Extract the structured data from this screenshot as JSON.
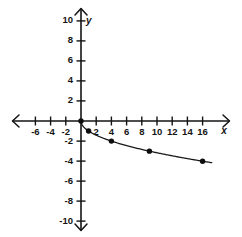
{
  "figure": {
    "width": 242,
    "height": 237,
    "background": "#ffffff",
    "ink_color": "#141414"
  },
  "axes": {
    "x_axis_label": "x",
    "y_axis_label": "y",
    "origin_label": "",
    "x_tick_labels": [
      "-6",
      "-4",
      "-2",
      "2",
      "4",
      "6",
      "8",
      "10",
      "12",
      "14",
      "16"
    ],
    "y_tick_labels": [
      "10",
      "8",
      "6",
      "4",
      "2",
      "-2",
      "-4",
      "-6",
      "-8",
      "-10"
    ]
  },
  "chart_data": {
    "type": "line",
    "title": "",
    "subtitle": "",
    "xlabel": "x",
    "ylabel": "y",
    "xlim": [
      -7.5,
      17.5
    ],
    "ylim": [
      -11,
      11
    ],
    "xticks": [
      -6,
      -4,
      -2,
      2,
      4,
      6,
      8,
      10,
      12,
      14,
      16
    ],
    "yticks": [
      10,
      8,
      6,
      4,
      2,
      -2,
      -4,
      -6,
      -8,
      -10
    ],
    "xtick_interval": 2,
    "ytick_interval": 2,
    "grid": false,
    "legend": false,
    "legend_position": "none",
    "annotations": [],
    "series": [
      {
        "name": "y = -sqrt(x)",
        "marker": "filled-circle",
        "line_style": "solid",
        "color": "#141414",
        "x": [
          0,
          1,
          4,
          9,
          16
        ],
        "values": [
          0,
          -1,
          -2,
          -3,
          -4
        ],
        "points": [
          {
            "x": 0,
            "y": 0
          },
          {
            "x": 1,
            "y": -1
          },
          {
            "x": 4,
            "y": -2
          },
          {
            "x": 9,
            "y": -3
          },
          {
            "x": 16,
            "y": -4
          }
        ],
        "curve_domain": [
          0,
          17.2
        ]
      }
    ]
  }
}
